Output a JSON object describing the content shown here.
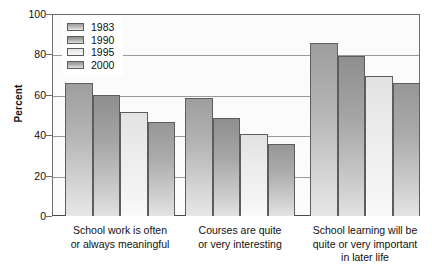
{
  "chart_data": {
    "type": "bar",
    "title": "",
    "subtitle": "",
    "xlabel": "",
    "ylabel": "Percent",
    "ylim": [
      0,
      100
    ],
    "yticks": [
      0,
      20,
      40,
      60,
      80,
      100
    ],
    "grid": true,
    "legend_position": "top-left inside plot",
    "categories": [
      "School work is often or always meaningful",
      "Courses are quite or very interesting",
      "School learning will be quite or very important in later life"
    ],
    "category_lines": [
      [
        "School work is often",
        "or always meaningful"
      ],
      [
        "Courses are quite",
        "or very interesting"
      ],
      [
        "School learning will be",
        "quite or very important",
        "in later life"
      ]
    ],
    "series": [
      {
        "name": "1983",
        "color": "#b4b4b4",
        "values": [
          66,
          58.5,
          85.5
        ]
      },
      {
        "name": "1990",
        "color": "#a5a5a5",
        "values": [
          60,
          48.5,
          79
        ]
      },
      {
        "name": "1995",
        "color": "#ececec",
        "values": [
          51.5,
          40.5,
          69.5
        ]
      },
      {
        "name": "2000",
        "color": "#ababab",
        "values": [
          46.5,
          35.5,
          66
        ]
      }
    ]
  },
  "legend": {
    "items": [
      {
        "label": "1983"
      },
      {
        "label": "1990"
      },
      {
        "label": "1995"
      },
      {
        "label": "2000"
      }
    ]
  },
  "axis": {
    "y_title": "Percent",
    "y_ticks": [
      "100",
      "80",
      "60",
      "40",
      "20",
      "0"
    ]
  }
}
